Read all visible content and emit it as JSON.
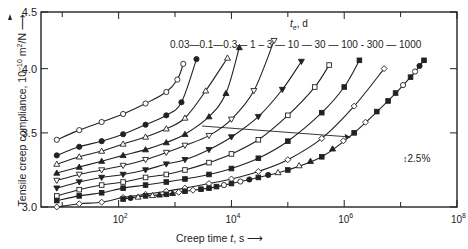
{
  "chart_data": {
    "type": "line",
    "title": "",
    "xlabel": "Creep time t, s",
    "ylabel": "Tensile creep compliance, 10^-10 m^2/N",
    "xscale": "log",
    "yscale": "log",
    "xlim": [
      4.2,
      100000000
    ],
    "ylim": [
      3.0,
      4.5
    ],
    "x_ticks": [
      "10^2",
      "10^4",
      "10^6",
      "10^8"
    ],
    "x_tick_labels": [
      {
        "base": "10",
        "exp": "2"
      },
      {
        "base": "10",
        "exp": "4"
      },
      {
        "base": "10",
        "exp": "6"
      },
      {
        "base": "10",
        "exp": "8"
      }
    ],
    "y_ticks": [
      "3.0",
      "3.5",
      "4.0",
      "4.5"
    ],
    "grid": false,
    "legend_title": "t_e, d",
    "legend_row": "0.03—0.1—0.3— 1 – 3 — 10 — 30 — 100 - 300 — 1000",
    "annotations": [
      "2.5%",
      "arrow from ageing-time curves toward master curve (horizontal shift)"
    ],
    "series": [
      {
        "name": "0.03",
        "marker": "open-circle",
        "points": [
          [
            8,
            3.45
          ],
          [
            20,
            3.52
          ],
          [
            50,
            3.58
          ],
          [
            120,
            3.64
          ],
          [
            300,
            3.72
          ],
          [
            700,
            3.81
          ],
          [
            1100,
            3.91
          ],
          [
            1400,
            4.04
          ]
        ]
      },
      {
        "name": "0.1",
        "marker": "filled-circle",
        "points": [
          [
            8,
            3.34
          ],
          [
            20,
            3.4
          ],
          [
            50,
            3.44
          ],
          [
            120,
            3.49
          ],
          [
            300,
            3.56
          ],
          [
            700,
            3.63
          ],
          [
            1300,
            3.73
          ],
          [
            2400,
            4.08
          ]
        ]
      },
      {
        "name": "0.3",
        "marker": "open-triangle",
        "points": [
          [
            8,
            3.28
          ],
          [
            20,
            3.33
          ],
          [
            50,
            3.37
          ],
          [
            120,
            3.42
          ],
          [
            300,
            3.47
          ],
          [
            700,
            3.53
          ],
          [
            1500,
            3.61
          ],
          [
            3500,
            3.82
          ],
          [
            8500,
            4.09
          ]
        ]
      },
      {
        "name": "1",
        "marker": "filled-triangle",
        "points": [
          [
            8,
            3.22
          ],
          [
            20,
            3.26
          ],
          [
            50,
            3.3
          ],
          [
            120,
            3.34
          ],
          [
            300,
            3.38
          ],
          [
            700,
            3.43
          ],
          [
            1500,
            3.49
          ],
          [
            4000,
            3.62
          ],
          [
            8000,
            3.8
          ],
          [
            13800,
            4.18
          ]
        ]
      },
      {
        "name": "3",
        "marker": "open-inverted-triangle",
        "points": [
          [
            8,
            3.17
          ],
          [
            20,
            3.21
          ],
          [
            50,
            3.24
          ],
          [
            120,
            3.27
          ],
          [
            300,
            3.31
          ],
          [
            700,
            3.36
          ],
          [
            1500,
            3.41
          ],
          [
            4000,
            3.48
          ],
          [
            10000,
            3.6
          ],
          [
            25000,
            3.82
          ],
          [
            57000,
            4.24
          ]
        ]
      },
      {
        "name": "10",
        "marker": "filled-inverted-triangle",
        "points": [
          [
            8,
            3.12
          ],
          [
            20,
            3.16
          ],
          [
            50,
            3.19
          ],
          [
            120,
            3.21
          ],
          [
            300,
            3.24
          ],
          [
            700,
            3.28
          ],
          [
            1500,
            3.31
          ],
          [
            4000,
            3.38
          ],
          [
            10000,
            3.47
          ],
          [
            30000,
            3.62
          ],
          [
            80000,
            3.83
          ],
          [
            174000,
            4.06
          ]
        ]
      },
      {
        "name": "30",
        "marker": "open-square",
        "points": [
          [
            8,
            3.07
          ],
          [
            20,
            3.11
          ],
          [
            50,
            3.14
          ],
          [
            120,
            3.16
          ],
          [
            300,
            3.19
          ],
          [
            700,
            3.21
          ],
          [
            1500,
            3.24
          ],
          [
            4000,
            3.29
          ],
          [
            10000,
            3.35
          ],
          [
            30000,
            3.45
          ],
          [
            100000,
            3.63
          ],
          [
            300000,
            3.85
          ],
          [
            540000,
            4.03
          ]
        ]
      },
      {
        "name": "100",
        "marker": "filled-square",
        "points": [
          [
            8,
            3.04
          ],
          [
            20,
            3.07
          ],
          [
            50,
            3.09
          ],
          [
            120,
            3.12
          ],
          [
            300,
            3.14
          ],
          [
            700,
            3.16
          ],
          [
            1500,
            3.18
          ],
          [
            4000,
            3.21
          ],
          [
            10000,
            3.25
          ],
          [
            30000,
            3.32
          ],
          [
            100000,
            3.44
          ],
          [
            400000,
            3.65
          ],
          [
            1000000,
            3.85
          ],
          [
            1860000,
            4.07
          ]
        ]
      },
      {
        "name": "300",
        "marker": "open-diamond",
        "points": [
          [
            8,
            3.0
          ],
          [
            20,
            3.02
          ],
          [
            50,
            3.03
          ],
          [
            120,
            3.06
          ],
          [
            300,
            3.08
          ],
          [
            700,
            3.1
          ],
          [
            1500,
            3.12
          ],
          [
            4000,
            3.15
          ],
          [
            10000,
            3.18
          ],
          [
            30000,
            3.23
          ],
          [
            100000,
            3.31
          ],
          [
            400000,
            3.46
          ],
          [
            1500000,
            3.7
          ],
          [
            5100000,
            4.0
          ]
        ]
      },
      {
        "name": "1000",
        "marker": "filled-square-master",
        "points": [
          [
            120,
            3.05
          ],
          [
            300,
            3.07
          ],
          [
            700,
            3.08
          ],
          [
            1500,
            3.1
          ],
          [
            4000,
            3.12
          ],
          [
            10000,
            3.15
          ],
          [
            30000,
            3.19
          ],
          [
            100000,
            3.24
          ],
          [
            400000,
            3.33
          ],
          [
            1500000,
            3.5
          ],
          [
            6000000,
            3.74
          ],
          [
            15000000,
            3.93
          ],
          [
            26000000,
            4.07
          ]
        ]
      }
    ]
  },
  "labels": {
    "ylabel": "Tensile creep compliance, 10",
    "ylabel_exp": "−10",
    "ylabel_tail": " m",
    "ylabel_exp2": "2",
    "ylabel_unit": "/N",
    "xlabel": "Creep time ",
    "xlabel_var": "t",
    "xlabel_unit": ", s",
    "legend_title": "t",
    "legend_title_sub": "e",
    "legend_title_unit": ", d",
    "legend_row": "0.03—0.1—0.3— 1 – 3 — 10 — 30 — 100 - 300 — 1000",
    "scale_note": "2.5%",
    "yticks": [
      "4.5",
      "4.0",
      "3.5",
      "3.0"
    ]
  }
}
